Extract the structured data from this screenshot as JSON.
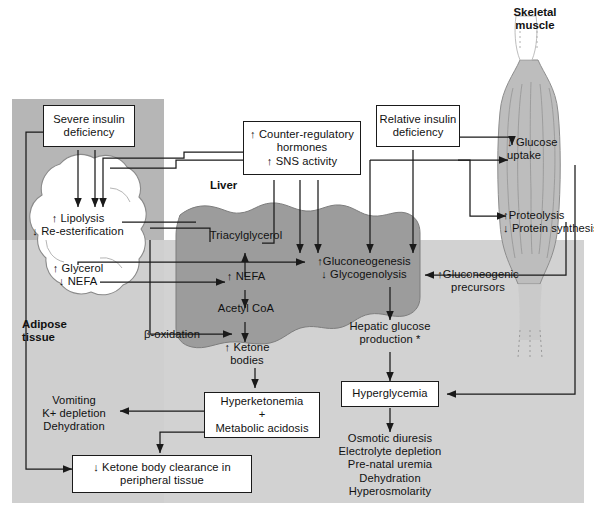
{
  "figure": {
    "colors": {
      "background": "#ffffff",
      "panel_light_gray": "#d9d9d9",
      "panel_mid_gray": "#c3c3c3",
      "adipose_panel_gray": "#b8b8b8",
      "liver_gray": "#9c9c9c",
      "muscle_gray": "#bdbdbd",
      "stroke": "#1a1a1a",
      "text": "#111111"
    }
  },
  "organs": {
    "skeletal_muscle": "Skeletal\nmuscle",
    "liver": "Liver",
    "adipose_tissue": "Adipose\ntissue"
  },
  "boxes": {
    "severe_insulin_deficiency": "Severe insulin\ndeficiency",
    "counter_regulatory": "↑ Counter-regulatory\nhormones\n↑ SNS activity",
    "relative_insulin_deficiency": "Relative insulin\ndeficiency",
    "hyperketonemia": "Hyperketonemia\n+\nMetabolic acidosis",
    "ketone_body_clearance": "↓ Ketone body clearance in\nperipheral tissue",
    "hyperglycemia": "Hyperglycemia"
  },
  "nodes": {
    "lipolysis": "↑ Lipolysis\n↓ Re-esterification",
    "glycerol_nefa": "↑ Glycerol\n↓ NEFA",
    "triacylglycerol": "Triacylglycerol",
    "nefa_liver": "↑ NEFA",
    "acetyl_coa": "Acetyl CoA",
    "beta_oxidation": "β-oxidation",
    "ketone_bodies": "↑ Ketone\nbodies",
    "gluconeogenesis": "↑Gluconeogenesis\n↓ Glycogenolysis",
    "hepatic_glucose_production": "Hepatic glucose\nproduction *",
    "gluconeogenic_precursors": "↑Gluconeogenic\nprecursors",
    "glucose_uptake": "↓ Glucose\nuptake",
    "proteolysis": "↑Proteolysis\n↓ Protein synthesis"
  },
  "outcomes": {
    "left_list": "Vomiting\nK+ depletion\nDehydration",
    "right_list": "Osmotic diuresis\nElectrolyte depletion\nPre-natal uremia\nDehydration\nHyperosmolarity"
  }
}
